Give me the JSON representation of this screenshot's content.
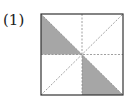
{
  "problem": {
    "label": "(1)"
  },
  "figure": {
    "shape": "square",
    "divisions": [
      "vertical-midline",
      "horizontal-midline",
      "diagonal-bottom-left-to-top-right",
      "diagonal-top-left-to-bottom-right"
    ],
    "shaded_regions": [
      "top-left-lower-triangle",
      "bottom-right-lower-triangle"
    ],
    "colors": {
      "outline": "#333333",
      "dashed": "#888888",
      "shade": "#a6a6a6",
      "background": "#ffffff"
    }
  }
}
